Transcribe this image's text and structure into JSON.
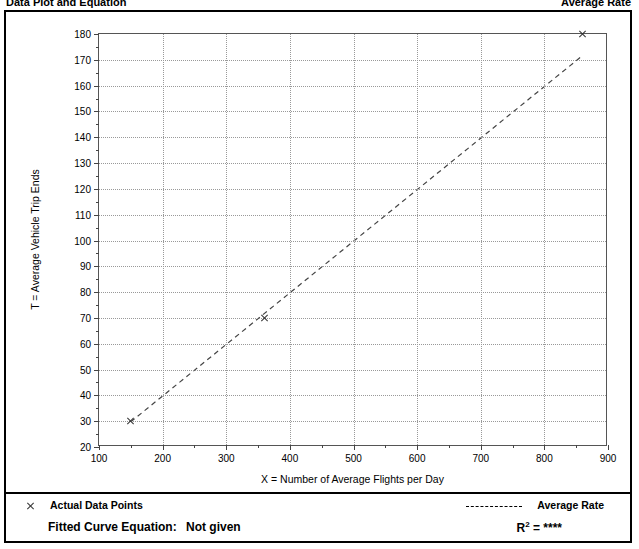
{
  "header": {
    "left_title": "Data Plot and Equation",
    "right_title": "Average Rate"
  },
  "chart_data": {
    "type": "scatter",
    "title": "",
    "xlabel": "X = Number of Average Flights per Day",
    "ylabel": "T = Average Vehicle Trip Ends",
    "xlim": [
      100,
      900
    ],
    "ylim": [
      20,
      180
    ],
    "xticks": [
      100,
      200,
      300,
      400,
      500,
      600,
      700,
      800,
      900
    ],
    "yticks": [
      20,
      30,
      40,
      50,
      60,
      70,
      80,
      90,
      100,
      110,
      120,
      130,
      140,
      150,
      160,
      170,
      180
    ],
    "xtick_labels": [
      "100",
      "200",
      "300",
      "400",
      "500",
      "600",
      "700",
      "800",
      "900"
    ],
    "ytick_labels": [
      "20",
      "30",
      "40",
      "50",
      "60",
      "70",
      "80",
      "90",
      "100",
      "110",
      "120",
      "130",
      "140",
      "150",
      "160",
      "170",
      "180"
    ],
    "grid": true,
    "legend_position": "below-plot",
    "series": [
      {
        "name": "Actual Data Points",
        "type": "scatter",
        "marker": "x",
        "points": [
          {
            "x": 150,
            "y": 30
          },
          {
            "x": 360,
            "y": 70
          },
          {
            "x": 860,
            "y": 180
          }
        ]
      },
      {
        "name": "Average Rate",
        "type": "line",
        "style": "dashed",
        "points": [
          {
            "x": 150,
            "y": 29
          },
          {
            "x": 860,
            "y": 171
          }
        ]
      }
    ]
  },
  "legend": {
    "data_points_label": "Actual Data Points",
    "average_rate_label": "Average Rate",
    "fitted_curve_label": "Fitted Curve Equation:",
    "fitted_curve_value": "Not given",
    "r_squared_label": "R",
    "r_squared_exponent": "2",
    "r_squared_equals": "=",
    "r_squared_value": "****"
  }
}
